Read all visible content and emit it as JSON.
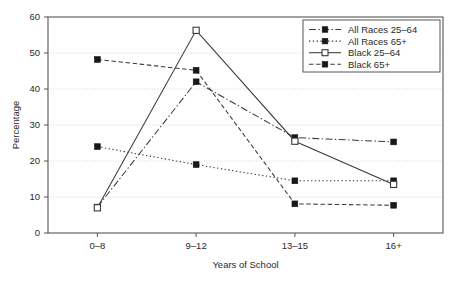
{
  "chart_data": {
    "type": "line",
    "title": "",
    "xlabel": "Years of School",
    "ylabel": "Percentage",
    "categories": [
      "0–8",
      "9–12",
      "13–15",
      "16+"
    ],
    "ylim": [
      0,
      60
    ],
    "yticks": [
      0,
      10,
      20,
      30,
      40,
      50,
      60
    ],
    "ytick_labels": [
      "0",
      "10",
      "20",
      "30",
      "40",
      "50",
      "60"
    ],
    "grid": true,
    "legend_position": "top-right",
    "series": [
      {
        "name": "All Races 25–64",
        "values": [
          7.2,
          42.0,
          26.5,
          25.3
        ],
        "line_style": "dash-dot",
        "marker": "filled-square"
      },
      {
        "name": "All Races 65+",
        "values": [
          24.0,
          19.0,
          14.5,
          14.5
        ],
        "line_style": "dotted",
        "marker": "filled-square"
      },
      {
        "name": "Black 25–64",
        "values": [
          7.0,
          56.3,
          25.5,
          13.5
        ],
        "line_style": "solid",
        "marker": "open-square"
      },
      {
        "name": "Black 65+",
        "values": [
          48.2,
          45.2,
          8.1,
          7.7
        ],
        "line_style": "dashed",
        "marker": "filled-square"
      }
    ]
  },
  "legend": {
    "entries": [
      {
        "label": "All Races 25–64"
      },
      {
        "label": "All Races 65+"
      },
      {
        "label": "Black 25–64"
      },
      {
        "label": "Black 65+"
      }
    ]
  },
  "colors": {
    "line": "#3a3a3a",
    "marker_fill": "#181818",
    "grid": "#c8c8c8",
    "frame": "#555555",
    "background": "#ffffff"
  }
}
